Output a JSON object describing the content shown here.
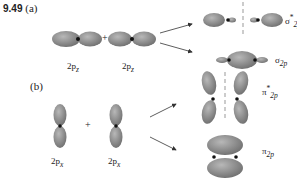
{
  "figure": {
    "problem_number": "9.49",
    "colors": {
      "lobe": "#8a8a8a",
      "lobe_highlight": "#b4b4b4",
      "nucleus": "#111111",
      "arrow": "#333333",
      "node_line": "#999999"
    }
  },
  "part_a": {
    "label": "(a)",
    "plus": "+",
    "atomic_orbitals": [
      {
        "label": "2p",
        "sub": "z"
      },
      {
        "label": "2p",
        "sub": "z"
      }
    ],
    "molecular_orbitals": [
      {
        "symbol": "σ",
        "star": "*",
        "sub": "2p",
        "type": "antibonding"
      },
      {
        "symbol": "σ",
        "star": "",
        "sub": "2p",
        "type": "bonding"
      }
    ]
  },
  "part_b": {
    "label": "(b)",
    "plus": "+",
    "atomic_orbitals": [
      {
        "label": "2p",
        "sub": "x"
      },
      {
        "label": "2p",
        "sub": "x"
      }
    ],
    "molecular_orbitals": [
      {
        "symbol": "π",
        "star": "*",
        "sub": "2p",
        "type": "antibonding"
      },
      {
        "symbol": "π",
        "star": "",
        "sub": "2p",
        "type": "bonding"
      }
    ]
  }
}
